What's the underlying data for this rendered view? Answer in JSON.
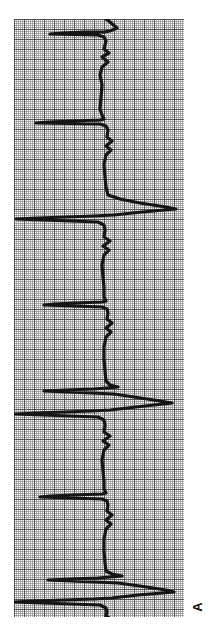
{
  "figure": {
    "panel_label": "A",
    "paper": {
      "left": 14,
      "top": 19,
      "width": 170,
      "height": 598,
      "minor_cell_px": 2,
      "major_cell_px": 10,
      "background_color": "#fbfbfb",
      "minor_line_color": "#787878",
      "major_line_color": "#3c3c3c"
    },
    "trace": {
      "color": "#151515",
      "stroke_width": 3.2,
      "orientation": "vertical",
      "baseline_x": 92,
      "description": "electrocardiogram rhythm strip rotated 90 degrees"
    }
  },
  "chart_data": {
    "type": "line",
    "title": "",
    "xlabel": "",
    "ylabel": "",
    "grid": true,
    "legend_position": "none",
    "axis_note": "ECG strip printed sideways: time runs top-to-bottom, voltage deflects left-right",
    "xlim": [
      0,
      170
    ],
    "ylim": [
      0,
      598
    ],
    "beats": [
      {
        "index": 1,
        "qrs_time_px": 12,
        "r_peak_amplitude_px": 78,
        "t_wave_amplitude_px": 24
      },
      {
        "index": 2,
        "qrs_time_px": 101,
        "r_peak_amplitude_px": 72,
        "t_wave_amplitude_px": 26
      },
      {
        "index": 3,
        "qrs_time_px": 191,
        "r_peak_amplitude_px": 100,
        "t_wave_amplitude_px": 25
      },
      {
        "index": 4,
        "qrs_time_px": 281,
        "r_peak_amplitude_px": 74,
        "t_wave_amplitude_px": 24
      },
      {
        "index": 5,
        "qrs_time_px": 368,
        "r_peak_amplitude_px": 92,
        "t_wave_amplitude_px": 28
      },
      {
        "index": 6,
        "qrs_time_px": 456,
        "r_peak_amplitude_px": 76,
        "t_wave_amplitude_px": 24
      },
      {
        "index": 7,
        "qrs_time_px": 543,
        "r_peak_amplitude_px": 98,
        "t_wave_amplitude_px": 26
      }
    ],
    "series": [
      {
        "name": "ECG lead",
        "points": [
          [
            92,
            0
          ],
          [
            96,
            3
          ],
          [
            103,
            9
          ],
          [
            96,
            12
          ],
          [
            90,
            13
          ],
          [
            70,
            13
          ],
          [
            48,
            14
          ],
          [
            36,
            15
          ],
          [
            84,
            16
          ],
          [
            90,
            18
          ],
          [
            92,
            22
          ],
          [
            90,
            30
          ],
          [
            95,
            34
          ],
          [
            88,
            38
          ],
          [
            94,
            43
          ],
          [
            88,
            48
          ],
          [
            86,
            56
          ],
          [
            88,
            66
          ],
          [
            87,
            78
          ],
          [
            86,
            90
          ],
          [
            88,
            96
          ],
          [
            90,
            100
          ],
          [
            86,
            101
          ],
          [
            60,
            102
          ],
          [
            34,
            103
          ],
          [
            22,
            104
          ],
          [
            86,
            105
          ],
          [
            92,
            107
          ],
          [
            94,
            111
          ],
          [
            93,
            118
          ],
          [
            98,
            122
          ],
          [
            92,
            127
          ],
          [
            97,
            131
          ],
          [
            92,
            136
          ],
          [
            90,
            145
          ],
          [
            91,
            158
          ],
          [
            92,
            168
          ],
          [
            94,
            176
          ],
          [
            106,
            180
          ],
          [
            126,
            184
          ],
          [
            152,
            188
          ],
          [
            162,
            190
          ],
          [
            128,
            193
          ],
          [
            100,
            196
          ],
          [
            80,
            197
          ],
          [
            52,
            198
          ],
          [
            24,
            199
          ],
          [
            2,
            200
          ],
          [
            84,
            203
          ],
          [
            90,
            206
          ],
          [
            91,
            211
          ],
          [
            90,
            218
          ],
          [
            96,
            222
          ],
          [
            89,
            227
          ],
          [
            95,
            231
          ],
          [
            90,
            236
          ],
          [
            88,
            246
          ],
          [
            89,
            258
          ],
          [
            90,
            268
          ],
          [
            90,
            278
          ],
          [
            92,
            282
          ],
          [
            88,
            283
          ],
          [
            62,
            284
          ],
          [
            40,
            285
          ],
          [
            30,
            286
          ],
          [
            88,
            288
          ],
          [
            93,
            290
          ],
          [
            94,
            294
          ],
          [
            93,
            300
          ],
          [
            98,
            304
          ],
          [
            92,
            309
          ],
          [
            97,
            313
          ],
          [
            92,
            318
          ],
          [
            90,
            328
          ],
          [
            90,
            340
          ],
          [
            91,
            352
          ],
          [
            92,
            362
          ],
          [
            96,
            366
          ],
          [
            104,
            368
          ],
          [
            80,
            370
          ],
          [
            52,
            371
          ],
          [
            30,
            372
          ],
          [
            100,
            375
          ],
          [
            120,
            378
          ],
          [
            146,
            382
          ],
          [
            158,
            384
          ],
          [
            122,
            388
          ],
          [
            96,
            391
          ],
          [
            78,
            392
          ],
          [
            50,
            393
          ],
          [
            22,
            394
          ],
          [
            1,
            395
          ],
          [
            84,
            398
          ],
          [
            90,
            401
          ],
          [
            91,
            406
          ],
          [
            90,
            413
          ],
          [
            96,
            417
          ],
          [
            89,
            422
          ],
          [
            95,
            426
          ],
          [
            90,
            431
          ],
          [
            88,
            441
          ],
          [
            89,
            452
          ],
          [
            90,
            462
          ],
          [
            90,
            470
          ],
          [
            92,
            474
          ],
          [
            88,
            475
          ],
          [
            58,
            476
          ],
          [
            36,
            477
          ],
          [
            26,
            478
          ],
          [
            88,
            480
          ],
          [
            93,
            482
          ],
          [
            94,
            486
          ],
          [
            93,
            492
          ],
          [
            98,
            496
          ],
          [
            92,
            501
          ],
          [
            97,
            505
          ],
          [
            92,
            510
          ],
          [
            90,
            520
          ],
          [
            90,
            532
          ],
          [
            91,
            544
          ],
          [
            92,
            552
          ],
          [
            98,
            555
          ],
          [
            108,
            557
          ],
          [
            84,
            559
          ],
          [
            56,
            560
          ],
          [
            34,
            561
          ],
          [
            104,
            564
          ],
          [
            126,
            567
          ],
          [
            152,
            571
          ],
          [
            160,
            573
          ],
          [
            124,
            576
          ],
          [
            98,
            579
          ],
          [
            80,
            580
          ],
          [
            50,
            581
          ],
          [
            20,
            582
          ],
          [
            0,
            583
          ],
          [
            86,
            586
          ],
          [
            92,
            589
          ],
          [
            93,
            593
          ],
          [
            92,
            597
          ],
          [
            97,
            600
          ],
          [
            90,
            605
          ],
          [
            96,
            609
          ],
          [
            91,
            613
          ],
          [
            90,
            618
          ],
          [
            91,
            624
          ],
          [
            92,
            630
          ]
        ]
      }
    ]
  }
}
